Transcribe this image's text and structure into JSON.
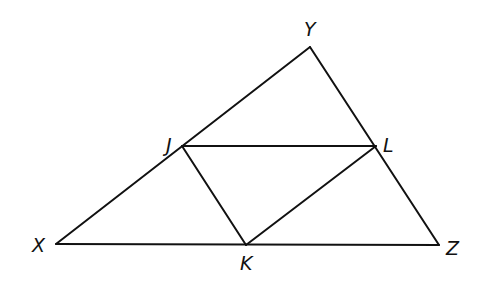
{
  "diagram": {
    "type": "triangle-midsegments",
    "points": {
      "X": {
        "label": "X",
        "x": 56,
        "y": 244,
        "lx": 32,
        "ly": 252
      },
      "Y": {
        "label": "Y",
        "x": 310,
        "y": 47,
        "lx": 304,
        "ly": 36
      },
      "Z": {
        "label": "Z",
        "x": 439,
        "y": 245,
        "lx": 446,
        "ly": 255
      },
      "J": {
        "label": "J",
        "x": 182,
        "y": 146,
        "lx": 166,
        "ly": 152
      },
      "L": {
        "label": "L",
        "x": 376,
        "y": 146,
        "lx": 383,
        "ly": 152
      },
      "K": {
        "label": "K",
        "x": 246,
        "y": 245,
        "lx": 240,
        "ly": 270
      }
    },
    "segments": [
      [
        "X",
        "Y"
      ],
      [
        "Y",
        "Z"
      ],
      [
        "X",
        "Z"
      ],
      [
        "J",
        "L"
      ],
      [
        "J",
        "K"
      ],
      [
        "K",
        "L"
      ]
    ],
    "stroke_color": "#111111"
  }
}
